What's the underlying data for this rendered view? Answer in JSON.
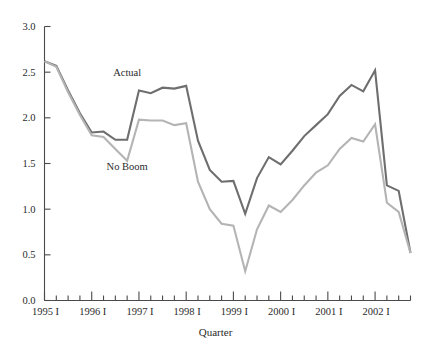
{
  "chart_data": {
    "type": "line",
    "title": "",
    "xlabel": "Quarter",
    "ylabel": "",
    "ylim": [
      0.0,
      3.0
    ],
    "ytick_values": [
      0.0,
      0.5,
      1.0,
      1.5,
      2.0,
      2.5,
      3.0
    ],
    "ytick_labels": [
      "0.0",
      "0.5",
      "1.0",
      "1.5",
      "2.0",
      "2.5",
      "3.0"
    ],
    "grid": false,
    "legend_position": "inline-annotations",
    "x_major_tick_labels": [
      "1995 I",
      "1996 I",
      "1997 I",
      "1998 I",
      "1999 I",
      "2000 I",
      "2001 I",
      "2002 I"
    ],
    "x_major_tick_index": [
      0,
      4,
      8,
      12,
      16,
      20,
      24,
      28
    ],
    "x_minor_tick_count": 32,
    "x": [
      "1995 I",
      "1995 II",
      "1995 III",
      "1995 IV",
      "1996 I",
      "1996 II",
      "1996 III",
      "1996 IV",
      "1997 I",
      "1997 II",
      "1997 III",
      "1997 IV",
      "1998 I",
      "1998 II",
      "1998 III",
      "1998 IV",
      "1999 I",
      "1999 II",
      "1999 III",
      "1999 IV",
      "2000 I",
      "2000 II",
      "2000 III",
      "2000 IV",
      "2001 I",
      "2001 II",
      "2001 III",
      "2001 IV",
      "2002 I",
      "2002 II",
      "2002 III",
      "2002 IV"
    ],
    "series": [
      {
        "name": "Actual",
        "color": "#6e6e6e",
        "label_x_index": 7,
        "label_y_value": 2.46,
        "values": [
          2.62,
          2.57,
          2.3,
          2.05,
          1.84,
          1.85,
          1.76,
          1.76,
          2.3,
          2.27,
          2.33,
          2.32,
          2.35,
          1.75,
          1.43,
          1.3,
          1.31,
          0.95,
          1.34,
          1.57,
          1.49,
          1.64,
          1.8,
          1.92,
          2.04,
          2.24,
          2.36,
          2.29,
          2.52,
          1.26,
          1.2,
          0.52
        ]
      },
      {
        "name": "No Boom",
        "color": "#b4b4b4",
        "label_x_index": 7,
        "label_y_value": 1.43,
        "values": [
          2.62,
          2.56,
          2.28,
          2.03,
          1.81,
          1.79,
          1.66,
          1.53,
          1.98,
          1.97,
          1.97,
          1.92,
          1.94,
          1.3,
          1.0,
          0.84,
          0.82,
          0.32,
          0.78,
          1.04,
          0.97,
          1.1,
          1.26,
          1.4,
          1.48,
          1.66,
          1.78,
          1.74,
          1.93,
          1.07,
          0.97,
          0.52
        ]
      }
    ]
  }
}
